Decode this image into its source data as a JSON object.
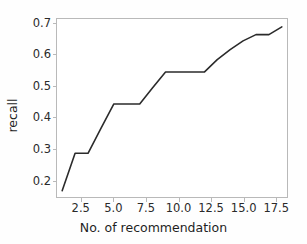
{
  "chart_data": {
    "type": "line",
    "title": "",
    "xlabel": "No. of recommendation",
    "ylabel": "recall",
    "x": [
      1,
      2,
      3,
      4,
      5,
      6,
      7,
      8,
      9,
      10,
      11,
      12,
      13,
      14,
      15,
      16,
      17,
      18
    ],
    "values": [
      0.165,
      0.285,
      0.285,
      0.365,
      0.443,
      0.443,
      0.443,
      0.495,
      0.545,
      0.545,
      0.545,
      0.545,
      0.585,
      0.617,
      0.645,
      0.665,
      0.665,
      0.69
    ],
    "series": [
      {
        "name": "recall",
        "values": [
          0.165,
          0.285,
          0.285,
          0.365,
          0.443,
          0.443,
          0.443,
          0.495,
          0.545,
          0.545,
          0.545,
          0.545,
          0.585,
          0.617,
          0.645,
          0.665,
          0.665,
          0.69
        ]
      }
    ],
    "xlim": [
      0.6,
      18.4
    ],
    "ylim": [
      0.145,
      0.715
    ],
    "xticks": [
      2.5,
      5.0,
      7.5,
      10.0,
      12.5,
      15.0,
      17.5
    ],
    "xtick_labels": [
      "2.5",
      "5.0",
      "7.5",
      "10.0",
      "12.5",
      "15.0",
      "17.5"
    ],
    "yticks": [
      0.2,
      0.3,
      0.4,
      0.5,
      0.6,
      0.7
    ],
    "ytick_labels": [
      "0.2",
      "0.3",
      "0.4",
      "0.5",
      "0.6",
      "0.7"
    ],
    "grid": false,
    "legend": null,
    "line_color": "#2b2b2b",
    "line_width": 1.6,
    "background_color": "#ffffff",
    "axes_color": "#b9b9b9"
  },
  "axis": {
    "x_label": "No. of recommendation",
    "y_label": "recall"
  }
}
